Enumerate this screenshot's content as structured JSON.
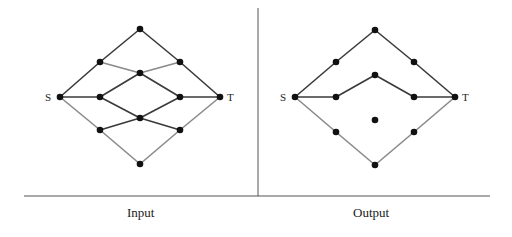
{
  "colors": {
    "dark_edge": "#3a3a3a",
    "light_edge": "#8a8a8a",
    "node": "#111111",
    "frame": "#555555"
  },
  "frame": {
    "horizontal": {
      "x1": 24,
      "y1": 196,
      "x2": 490,
      "y2": 196
    },
    "vertical": {
      "x1": 258,
      "y1": 8,
      "x2": 258,
      "y2": 196
    }
  },
  "panels": [
    {
      "id": "input",
      "caption": "Input",
      "caption_x": 127,
      "source_label": "S",
      "sink_label": "T",
      "nodes": {
        "top": [
          140,
          29
        ],
        "ul": [
          100,
          62
        ],
        "ur": [
          180,
          62
        ],
        "cu": [
          140,
          73
        ],
        "S": [
          60,
          97
        ],
        "ml": [
          100,
          97
        ],
        "mr": [
          180,
          97
        ],
        "T": [
          220,
          97
        ],
        "cl": [
          140,
          118
        ],
        "ll": [
          100,
          130
        ],
        "lr": [
          180,
          130
        ],
        "bot": [
          140,
          164
        ]
      },
      "edges": [
        [
          "S",
          "ul",
          "dark"
        ],
        [
          "ul",
          "top",
          "dark"
        ],
        [
          "top",
          "ur",
          "dark"
        ],
        [
          "ur",
          "T",
          "dark"
        ],
        [
          "ul",
          "cu",
          "light"
        ],
        [
          "cu",
          "ur",
          "light"
        ],
        [
          "S",
          "ml",
          "dark"
        ],
        [
          "ml",
          "cu",
          "dark"
        ],
        [
          "ml",
          "cl",
          "dark"
        ],
        [
          "cu",
          "mr",
          "dark"
        ],
        [
          "cl",
          "mr",
          "dark"
        ],
        [
          "mr",
          "T",
          "dark"
        ],
        [
          "S",
          "ll",
          "light"
        ],
        [
          "ll",
          "cl",
          "dark"
        ],
        [
          "cl",
          "lr",
          "dark"
        ],
        [
          "lr",
          "T",
          "light"
        ],
        [
          "ll",
          "bot",
          "light"
        ],
        [
          "bot",
          "lr",
          "light"
        ]
      ]
    },
    {
      "id": "output",
      "caption": "Output",
      "caption_x": 353,
      "source_label": "S",
      "sink_label": "T",
      "nodes": {
        "top": [
          375,
          30
        ],
        "ul": [
          336,
          62
        ],
        "ur": [
          414,
          62
        ],
        "cu": [
          375,
          75
        ],
        "S": [
          295,
          97
        ],
        "ml": [
          336,
          97
        ],
        "mr": [
          414,
          97
        ],
        "T": [
          455,
          97
        ],
        "c": [
          375,
          120
        ],
        "ll": [
          336,
          132
        ],
        "lr": [
          414,
          132
        ],
        "bot": [
          375,
          165
        ]
      },
      "edges": [
        [
          "S",
          "ul",
          "dark"
        ],
        [
          "ul",
          "top",
          "dark"
        ],
        [
          "top",
          "ur",
          "dark"
        ],
        [
          "ur",
          "T",
          "dark"
        ],
        [
          "S",
          "ml",
          "dark"
        ],
        [
          "ml",
          "cu",
          "dark"
        ],
        [
          "cu",
          "mr",
          "dark"
        ],
        [
          "mr",
          "T",
          "dark"
        ],
        [
          "S",
          "ll",
          "light"
        ],
        [
          "ll",
          "bot",
          "light"
        ],
        [
          "bot",
          "lr",
          "light"
        ],
        [
          "lr",
          "T",
          "light"
        ]
      ]
    }
  ]
}
